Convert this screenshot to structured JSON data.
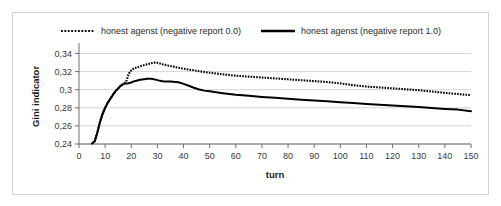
{
  "chart_data": {
    "type": "line",
    "title": "",
    "xlabel": "turn",
    "ylabel": "Gini indicator",
    "xlim": [
      0,
      150
    ],
    "ylim": [
      0.24,
      0.345
    ],
    "xticks": [
      0,
      10,
      20,
      30,
      40,
      50,
      60,
      70,
      80,
      90,
      100,
      110,
      120,
      130,
      140,
      150
    ],
    "xtick_labels": [
      "0",
      "10",
      "20",
      "30",
      "40",
      "50",
      "60",
      "70",
      "80",
      "90",
      "100",
      "110",
      "120",
      "130",
      "140",
      "150"
    ],
    "yticks": [
      0.24,
      0.26,
      0.28,
      0.3,
      0.32,
      0.34
    ],
    "ytick_labels": [
      "0,24",
      "0,26",
      "0,28",
      "0,3",
      "0,32",
      "0,34"
    ],
    "grid": true,
    "grid_axis": "y",
    "legend_position": "top",
    "decimal_separator": ",",
    "series": [
      {
        "name": "honest agenst (negative report 0.0)",
        "style": "dotted",
        "color": "#000000",
        "x": [
          5,
          6,
          7,
          8,
          9,
          10,
          11,
          12,
          13,
          14,
          15,
          16,
          17,
          18,
          19,
          20,
          21,
          22,
          23,
          24,
          25,
          26,
          27,
          28,
          29,
          30,
          31,
          32,
          33,
          34,
          35,
          36,
          37,
          38,
          39,
          40,
          42,
          44,
          46,
          48,
          50,
          55,
          60,
          65,
          70,
          75,
          80,
          85,
          90,
          95,
          100,
          105,
          110,
          115,
          120,
          125,
          130,
          135,
          140,
          145,
          150
        ],
        "values": [
          0.2405,
          0.243,
          0.2525,
          0.264,
          0.273,
          0.28,
          0.2855,
          0.29,
          0.2945,
          0.2985,
          0.3015,
          0.3045,
          0.3065,
          0.3085,
          0.3175,
          0.3215,
          0.3235,
          0.3245,
          0.3255,
          0.3265,
          0.3272,
          0.328,
          0.3288,
          0.3295,
          0.33,
          0.3298,
          0.329,
          0.3282,
          0.3275,
          0.3268,
          0.3262,
          0.3256,
          0.325,
          0.3244,
          0.3238,
          0.3232,
          0.3222,
          0.3215,
          0.3205,
          0.3196,
          0.3188,
          0.317,
          0.3155,
          0.3145,
          0.3135,
          0.3125,
          0.3115,
          0.3105,
          0.3095,
          0.3085,
          0.307,
          0.305,
          0.3035,
          0.3025,
          0.3015,
          0.3005,
          0.2995,
          0.298,
          0.2965,
          0.2952,
          0.294
        ]
      },
      {
        "name": "honest agenst (negative report 1.0)",
        "style": "solid",
        "color": "#000000",
        "x": [
          5,
          6,
          7,
          8,
          9,
          10,
          11,
          12,
          13,
          14,
          15,
          16,
          17,
          18,
          19,
          20,
          21,
          22,
          23,
          24,
          25,
          26,
          27,
          28,
          29,
          30,
          31,
          32,
          33,
          34,
          35,
          36,
          37,
          38,
          39,
          40,
          42,
          44,
          46,
          48,
          50,
          55,
          60,
          65,
          70,
          75,
          80,
          85,
          90,
          95,
          100,
          105,
          110,
          115,
          120,
          125,
          130,
          135,
          140,
          145,
          150
        ],
        "values": [
          0.2405,
          0.243,
          0.2525,
          0.264,
          0.273,
          0.28,
          0.2855,
          0.29,
          0.2945,
          0.2985,
          0.3015,
          0.3045,
          0.3062,
          0.307,
          0.3072,
          0.308,
          0.3092,
          0.31,
          0.3108,
          0.3112,
          0.3116,
          0.312,
          0.3122,
          0.312,
          0.3114,
          0.3106,
          0.3098,
          0.3094,
          0.3092,
          0.309,
          0.309,
          0.3088,
          0.3086,
          0.3082,
          0.3074,
          0.3064,
          0.3044,
          0.3022,
          0.3002,
          0.299,
          0.2982,
          0.2962,
          0.2945,
          0.2932,
          0.292,
          0.291,
          0.29,
          0.289,
          0.288,
          0.2872,
          0.2862,
          0.2852,
          0.2842,
          0.2834,
          0.2826,
          0.2818,
          0.2808,
          0.2798,
          0.2788,
          0.278,
          0.2762
        ]
      }
    ]
  },
  "legend": {
    "items": [
      {
        "label": "honest agenst (negative report 0.0)",
        "marker": "dotted-line-swatch"
      },
      {
        "label": "honest agenst (negative report 1.0)",
        "marker": "solid-line-swatch"
      }
    ]
  }
}
